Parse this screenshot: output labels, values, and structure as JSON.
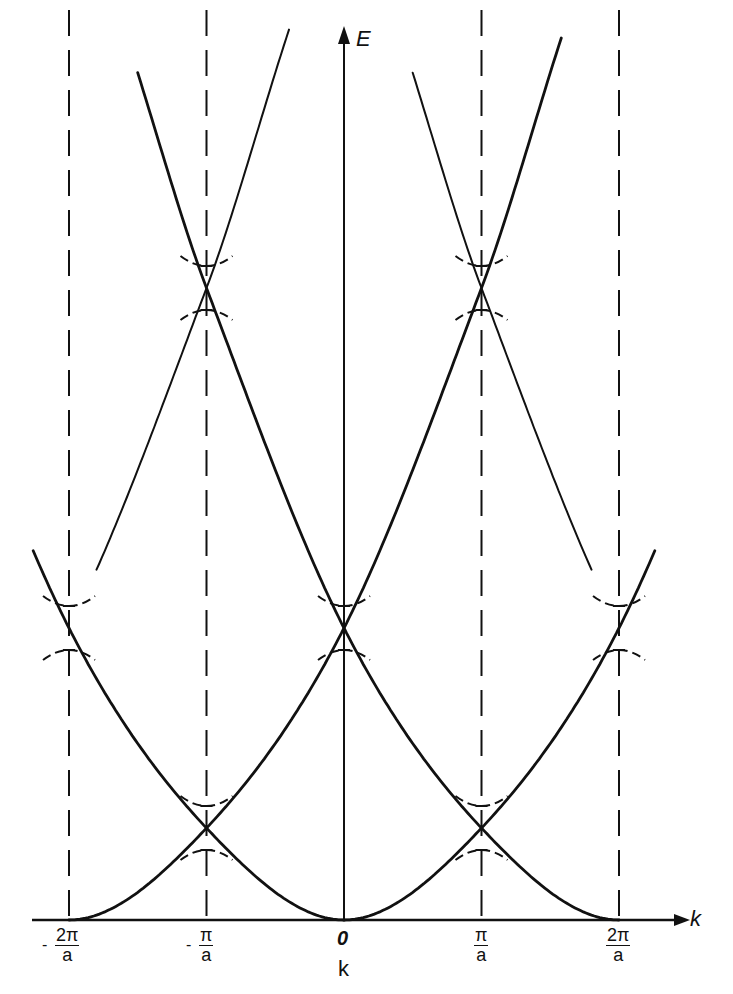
{
  "chart_data": {
    "type": "line",
    "title": "",
    "subtitle": "Free-electron energy bands in the extended (repeated) zone scheme with band gaps at zone boundaries",
    "xlabel": "k",
    "xlabel_below": "k",
    "ylabel": "E",
    "x_ticks": [
      {
        "value": -2,
        "minus": "-",
        "num": "2π",
        "den": "a"
      },
      {
        "value": -1,
        "minus": "-",
        "num": "π",
        "den": "a"
      },
      {
        "value": 0,
        "text": "0"
      },
      {
        "value": 1,
        "minus": "",
        "num": "π",
        "den": "a"
      },
      {
        "value": 2,
        "minus": "",
        "num": "2π",
        "den": "a"
      }
    ],
    "x_units": "π/a",
    "xlim": [
      -2.25,
      2.5
    ],
    "grid": false,
    "legend": null,
    "series": [
      {
        "name": "parabola centered at -4π/a (right arm)",
        "center": -4,
        "arm": "right",
        "d_range": [
          2.2,
          3.6
        ],
        "weight": "thin"
      },
      {
        "name": "parabola centered at -2π/a (right arm)",
        "center": -2,
        "arm": "right",
        "d_range": [
          0,
          3.58
        ],
        "weight": "bold"
      },
      {
        "name": "parabola centered at 0 (left arm)",
        "center": 0,
        "arm": "left",
        "d_range": [
          0,
          2.27
        ],
        "weight": "bold"
      },
      {
        "name": "parabola centered at 0 (right arm)",
        "center": 0,
        "arm": "right",
        "d_range": [
          0,
          2.27
        ],
        "weight": "bold"
      },
      {
        "name": "parabola centered at 2π/a (left arm)",
        "center": 2,
        "arm": "left",
        "d_range": [
          0,
          3.51
        ],
        "weight": "bold"
      },
      {
        "name": "parabola centered at 4π/a (left arm)",
        "center": 4,
        "arm": "left",
        "d_range": [
          2.2,
          3.5
        ],
        "weight": "thin"
      }
    ],
    "energy_profile": {
      "d": [
        0,
        1,
        2,
        3,
        4
      ],
      "E_px": [
        0,
        92,
        292,
        632,
        1020
      ]
    },
    "degeneracy_points": [
      {
        "k": -2,
        "E_px": 292,
        "gap": true
      },
      {
        "k": -1,
        "E_px": 92,
        "gap": true
      },
      {
        "k": -1,
        "E_px": 632,
        "gap": true
      },
      {
        "k": 0,
        "E_px": 292,
        "gap": true
      },
      {
        "k": 1,
        "E_px": 92,
        "gap": true
      },
      {
        "k": 1,
        "E_px": 632,
        "gap": true
      },
      {
        "k": 2,
        "E_px": 292,
        "gap": true
      }
    ],
    "zone_boundaries_dashed": [
      -2,
      -1,
      1,
      2
    ]
  },
  "labels": {
    "e_axis": "E",
    "k_axis": "k",
    "k_caption": "k",
    "origin": "0"
  }
}
